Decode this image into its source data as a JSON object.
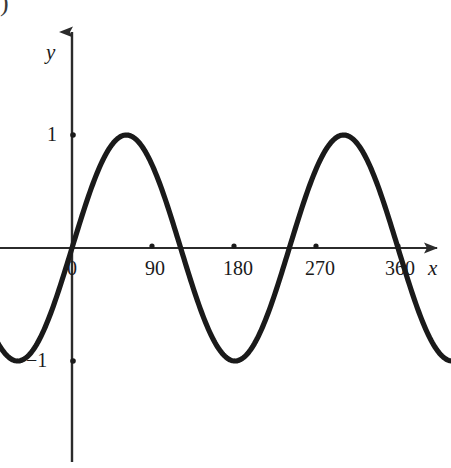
{
  "figure": {
    "corner_marker": ")",
    "background_color": "#ffffff",
    "curve_color": "#1a1a1a",
    "axis_color": "#2b2b2b"
  },
  "chart_data": {
    "type": "line",
    "title": "",
    "subtitle": "",
    "xlabel": "x",
    "ylabel": "y",
    "grid": false,
    "legend": "none",
    "axis_arrows": [
      "x-positive",
      "y-positive"
    ],
    "xlim": [
      -100,
      420
    ],
    "ylim": [
      -1.45,
      1.45
    ],
    "x_ticks": [
      0,
      90,
      180,
      270,
      360
    ],
    "x_tick_labels": [
      "0",
      "90",
      "180",
      "270",
      "360"
    ],
    "y_ticks": [
      1,
      -1
    ],
    "y_tick_labels": [
      "1",
      "−1"
    ],
    "series": [
      {
        "name": "y = sin(1.5x)",
        "amplitude": 1,
        "period_degrees": 240,
        "phase_degrees": 0,
        "key_points": [
          {
            "x": -90,
            "y": -1,
            "note": "minimum at left edge"
          },
          {
            "x": 0,
            "y": 0,
            "note": "rising zero at origin"
          },
          {
            "x": 60,
            "y": 1,
            "note": "first maximum"
          },
          {
            "x": 120,
            "y": 0,
            "note": "falling zero"
          },
          {
            "x": 180,
            "y": -1,
            "note": "minimum"
          },
          {
            "x": 240,
            "y": 0,
            "note": "rising zero"
          },
          {
            "x": 300,
            "y": 1,
            "note": "second maximum"
          },
          {
            "x": 360,
            "y": 0,
            "note": "falling zero"
          },
          {
            "x": 420,
            "y": -1,
            "note": "continues below axis"
          }
        ],
        "x": [
          -100,
          -90,
          -80,
          -70,
          -60,
          -50,
          -40,
          -30,
          -20,
          -10,
          0,
          10,
          20,
          30,
          40,
          50,
          60,
          70,
          80,
          90,
          100,
          110,
          120,
          130,
          140,
          150,
          160,
          170,
          180,
          190,
          200,
          210,
          220,
          230,
          240,
          250,
          260,
          270,
          280,
          290,
          300,
          310,
          320,
          330,
          340,
          350,
          360,
          370,
          380,
          390,
          400,
          410,
          420
        ],
        "y": [
          -0.99,
          -1.0,
          -0.99,
          -0.97,
          -0.93,
          -0.88,
          -0.81,
          -0.71,
          -0.59,
          -0.45,
          0.0,
          0.26,
          0.5,
          0.71,
          0.87,
          0.97,
          1.0,
          0.97,
          0.87,
          0.71,
          0.5,
          0.26,
          0.0,
          -0.26,
          -0.5,
          -0.71,
          -0.87,
          -0.97,
          -1.0,
          -0.97,
          -0.87,
          -0.71,
          -0.5,
          -0.26,
          0.0,
          0.26,
          0.5,
          0.71,
          0.87,
          0.97,
          1.0,
          0.97,
          0.87,
          0.71,
          0.5,
          0.26,
          0.0,
          -0.26,
          -0.5,
          -0.71,
          -0.87,
          -0.97,
          -1.0
        ]
      }
    ]
  }
}
